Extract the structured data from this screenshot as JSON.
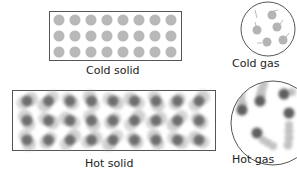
{
  "diagram": {
    "panels": [
      {
        "id": "cold-solid",
        "label": "Cold solid",
        "shape": "rectangle",
        "rows": 3,
        "cols": 8,
        "particle_color": "#b8b8b8",
        "motion": "minimal vibration"
      },
      {
        "id": "hot-solid",
        "label": "Hot solid",
        "shape": "rectangle",
        "rows": 3,
        "cols": 9,
        "particle_color": "#6e6e6e",
        "motion": "strong vibration (blurred)"
      },
      {
        "id": "cold-gas",
        "label": "Cold gas",
        "shape": "circle",
        "particles": 5,
        "particle_color": "#b0b0b0",
        "motion": "slow, short trails"
      },
      {
        "id": "hot-gas",
        "label": "Hot gas",
        "shape": "circle",
        "particles": 6,
        "particle_color": "#6a6a6a",
        "motion": "fast, long blurred trails"
      }
    ]
  },
  "colors": {
    "border": "#555555",
    "text": "#222222",
    "background": "#ffffff"
  }
}
